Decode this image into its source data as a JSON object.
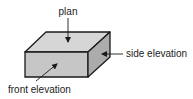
{
  "diagram": {
    "type": "orthographic-projection-box",
    "labels": {
      "plan": "plan",
      "side": "side elevation",
      "front": "front elevation"
    },
    "colors": {
      "top_face": "#d6d6d6",
      "front_face": "#c6c6c6",
      "side_face": "#acacac",
      "stroke": "#1a1a1a"
    }
  }
}
